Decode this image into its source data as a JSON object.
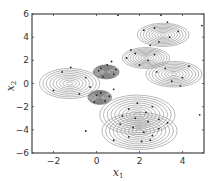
{
  "chart_data": {
    "type": "scatter",
    "title": "",
    "xlabel": "x_1",
    "ylabel": "x_2",
    "xlim": [
      -3,
      5
    ],
    "ylim": [
      -6,
      6
    ],
    "xticks": [
      -2,
      0,
      2,
      4
    ],
    "yticks": [
      -6,
      -4,
      -2,
      0,
      2,
      4,
      6
    ],
    "grid": false,
    "legend": null,
    "components": [
      {
        "name": "left-wide",
        "center": [
          -1.25,
          0.0
        ],
        "sx": 1.4,
        "sy": 1.3,
        "levels": 9,
        "dense": false
      },
      {
        "name": "small-upper-center",
        "center": [
          0.45,
          1.0
        ],
        "sx": 0.6,
        "sy": 0.6,
        "levels": 12,
        "dense": true
      },
      {
        "name": "small-lower-center",
        "center": [
          0.15,
          -1.2
        ],
        "sx": 0.55,
        "sy": 0.6,
        "levels": 12,
        "dense": true
      },
      {
        "name": "upper-right",
        "center": [
          3.1,
          4.2
        ],
        "sx": 1.2,
        "sy": 1.0,
        "levels": 9,
        "dense": false
      },
      {
        "name": "middle-right",
        "center": [
          2.3,
          2.2
        ],
        "sx": 1.1,
        "sy": 0.9,
        "levels": 9,
        "dense": false
      },
      {
        "name": "far-right",
        "center": [
          3.6,
          0.8
        ],
        "sx": 1.3,
        "sy": 1.1,
        "levels": 9,
        "dense": false
      },
      {
        "name": "lower-upper",
        "center": [
          1.9,
          -2.7
        ],
        "sx": 1.75,
        "sy": 1.7,
        "levels": 10,
        "dense": false
      },
      {
        "name": "lower-bottom",
        "center": [
          2.0,
          -4.1
        ],
        "sx": 1.75,
        "sy": 1.6,
        "levels": 10,
        "dense": false
      }
    ],
    "points": [
      [
        -1.6,
        1.0
      ],
      [
        -2.0,
        -0.6
      ],
      [
        -0.5,
        0.5
      ],
      [
        -0.8,
        -0.9
      ],
      [
        -1.2,
        1.4
      ],
      [
        -0.3,
        -0.3
      ],
      [
        0.2,
        1.3
      ],
      [
        0.5,
        1.6
      ],
      [
        0.8,
        0.8
      ],
      [
        0.3,
        0.6
      ],
      [
        0.7,
        1.9
      ],
      [
        0.1,
        1.1
      ],
      [
        0.9,
        1.2
      ],
      [
        0.0,
        -1.0
      ],
      [
        0.4,
        -1.5
      ],
      [
        0.2,
        -0.8
      ],
      [
        -0.1,
        -1.6
      ],
      [
        0.6,
        -1.1
      ],
      [
        0.8,
        -0.5
      ],
      [
        2.7,
        4.8
      ],
      [
        3.4,
        4.0
      ],
      [
        2.2,
        4.6
      ],
      [
        3.8,
        4.5
      ],
      [
        2.9,
        3.6
      ],
      [
        3.3,
        5.3
      ],
      [
        2.5,
        3.3
      ],
      [
        1.8,
        2.6
      ],
      [
        2.4,
        2.0
      ],
      [
        2.0,
        1.6
      ],
      [
        2.7,
        2.5
      ],
      [
        1.4,
        2.2
      ],
      [
        1.6,
        2.9
      ],
      [
        3.2,
        1.3
      ],
      [
        4.0,
        0.5
      ],
      [
        3.5,
        0.2
      ],
      [
        4.3,
        1.5
      ],
      [
        2.8,
        1.0
      ],
      [
        3.9,
        -0.2
      ],
      [
        1.5,
        -2.2
      ],
      [
        2.3,
        -2.5
      ],
      [
        1.8,
        -3.0
      ],
      [
        2.6,
        -2.0
      ],
      [
        1.2,
        -2.8
      ],
      [
        2.9,
        -3.1
      ],
      [
        1.9,
        -1.7
      ],
      [
        2.4,
        -3.3
      ],
      [
        1.7,
        -3.8
      ],
      [
        2.2,
        -4.2
      ],
      [
        2.6,
        -4.5
      ],
      [
        1.5,
        -4.6
      ],
      [
        2.9,
        -3.9
      ],
      [
        1.1,
        -3.5
      ],
      [
        2.1,
        -5.0
      ],
      [
        3.3,
        -3.4
      ],
      [
        0.8,
        -4.9
      ],
      [
        2.5,
        -4.9
      ],
      [
        -0.5,
        -4.1
      ],
      [
        4.8,
        -2.7
      ],
      [
        4.9,
        5.0
      ],
      [
        1.0,
        5.9
      ],
      [
        3.0,
        5.9
      ]
    ]
  }
}
